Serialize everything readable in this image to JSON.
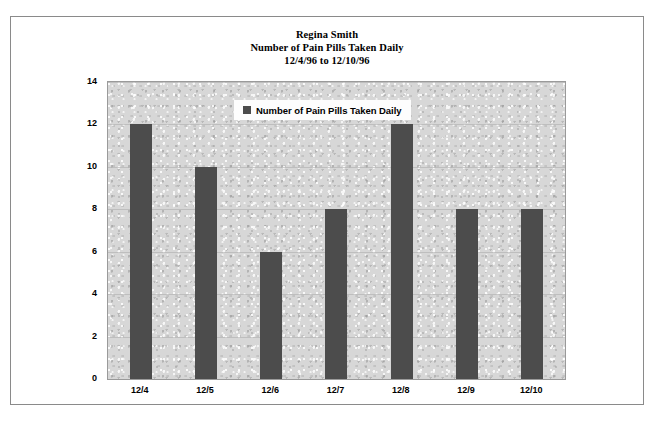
{
  "figure": {
    "title_lines": [
      "Regina Smith",
      "Number of Pain Pills Taken Daily",
      "12/4/96 to 12/10/96"
    ],
    "patient_name": "Regina Smith",
    "chart_caption": "Number of Pain Pills Taken Daily",
    "date_range": "12/4/96 to 12/10/96"
  },
  "legend": {
    "position": "inside-top-center",
    "entries": [
      {
        "label": "Number of Pain Pills Taken Daily",
        "color": "#4c4c4c"
      }
    ]
  },
  "colors": {
    "bar": "#4c4c4c",
    "plot_background": "#d7d7d7",
    "figure_background": "#ffffff",
    "frame_border": "#8a8a8a",
    "axis_text": "#000000"
  },
  "chart_data": {
    "type": "bar",
    "categories": [
      "12/4",
      "12/5",
      "12/6",
      "12/7",
      "12/8",
      "12/9",
      "12/10"
    ],
    "values": [
      12,
      10,
      6,
      8,
      12,
      8,
      8
    ],
    "series": [
      {
        "name": "Number of Pain Pills Taken Daily",
        "values": [
          12,
          10,
          6,
          8,
          12,
          8,
          8
        ],
        "color": "#4c4c4c"
      }
    ],
    "xlabel": "",
    "ylabel": "",
    "ylim": [
      0,
      14
    ],
    "yticks": [
      0,
      2,
      4,
      6,
      8,
      10,
      12,
      14
    ],
    "ytick_labels": [
      "0",
      "2",
      "4",
      "6",
      "8",
      "10",
      "12",
      "14"
    ],
    "grid": true,
    "legend_position": "inside-top-center"
  }
}
